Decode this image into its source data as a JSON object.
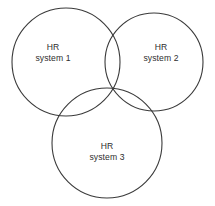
{
  "figure": {
    "type": "venn-diagram",
    "background_color": "#ffffff",
    "stroke_color": "#3a3a3a",
    "text_color": "#2e2e2e",
    "set_count": 3
  },
  "sets": [
    {
      "id": "hr-system-1",
      "line1": "HR",
      "line2": "system 1",
      "label_x": 53,
      "label_y": 53,
      "center_x": 66,
      "center_y": 62,
      "radius": 54
    },
    {
      "id": "hr-system-2",
      "line1": "HR",
      "line2": "system 2",
      "label_x": 161,
      "label_y": 53,
      "center_x": 154,
      "center_y": 62,
      "radius": 49
    },
    {
      "id": "hr-system-3",
      "line1": "HR",
      "line2": "system 3",
      "label_x": 107,
      "label_y": 152,
      "center_x": 107,
      "center_y": 143,
      "radius": 55
    }
  ]
}
